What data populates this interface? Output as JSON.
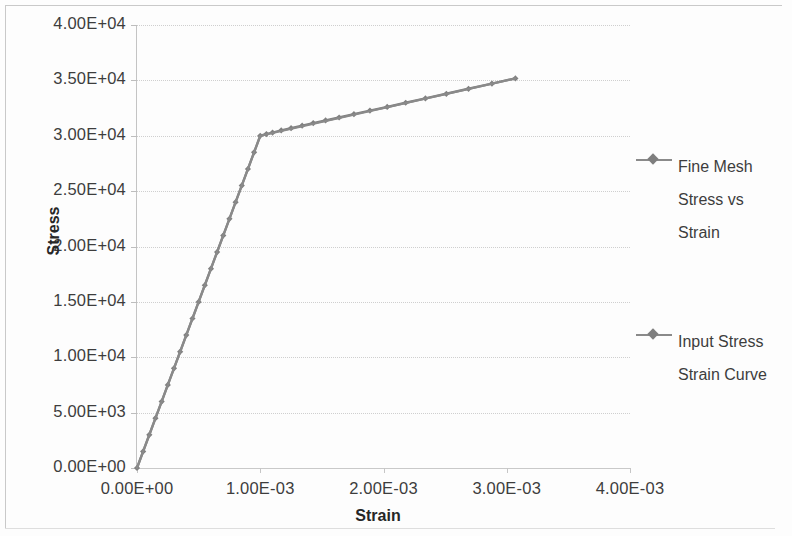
{
  "chart_data": {
    "type": "line",
    "title": "",
    "xlabel": "Strain",
    "ylabel": "Stress",
    "xlim": [
      0,
      0.004
    ],
    "ylim": [
      0,
      40000
    ],
    "grid": true,
    "legend_position": "right",
    "x_tick_labels": [
      "0.00E+00",
      "1.00E-03",
      "2.00E-03",
      "3.00E-03",
      "4.00E-03"
    ],
    "x_tick_values": [
      0,
      0.001,
      0.002,
      0.003,
      0.004
    ],
    "y_tick_labels": [
      "0.00E+00",
      "5.00E+03",
      "1.00E+04",
      "1.50E+04",
      "2.00E+04",
      "2.50E+04",
      "3.00E+04",
      "3.50E+04",
      "4.00E+04"
    ],
    "y_tick_values": [
      0,
      5000,
      10000,
      15000,
      20000,
      25000,
      30000,
      35000,
      40000
    ],
    "series": [
      {
        "name": "Fine Mesh Stress vs Strain",
        "color": "#808080",
        "marker": "diamond",
        "x": [
          0,
          5e-05,
          0.0001,
          0.00015,
          0.0002,
          0.00025,
          0.0003,
          0.00035,
          0.0004,
          0.00045,
          0.0005,
          0.00055,
          0.0006,
          0.00065,
          0.0007,
          0.00075,
          0.0008,
          0.00085,
          0.0009,
          0.00095,
          0.001,
          0.00105,
          0.0011,
          0.00117,
          0.00125,
          0.00134,
          0.00143,
          0.00153,
          0.00164,
          0.00176,
          0.00189,
          0.00203,
          0.00218,
          0.00234,
          0.00251,
          0.00269,
          0.00288,
          0.00307
        ],
        "y": [
          0,
          1500,
          3000,
          4500,
          6000,
          7500,
          9000,
          10500,
          12000,
          13500,
          15000,
          16500,
          18000,
          19500,
          21000,
          22500,
          24000,
          25500,
          27000,
          28500,
          30000,
          30150,
          30290,
          30480,
          30680,
          30910,
          31140,
          31380,
          31650,
          31950,
          32270,
          32600,
          32980,
          33370,
          33790,
          34240,
          34710,
          35180
        ]
      },
      {
        "name": "Input Stress Strain Curve",
        "color": "#8a8a8a",
        "marker": "diamond",
        "x": [
          0,
          0.001,
          0.00307
        ],
        "y": [
          0,
          30000,
          35180
        ]
      }
    ],
    "legend_entries": [
      {
        "label_lines": [
          "Fine Mesh",
          "Stress vs",
          "Strain"
        ],
        "color": "#8a8a8a"
      },
      {
        "label_lines": [
          "Input Stress",
          "Strain Curve"
        ],
        "color": "#8a8a8a"
      }
    ]
  }
}
